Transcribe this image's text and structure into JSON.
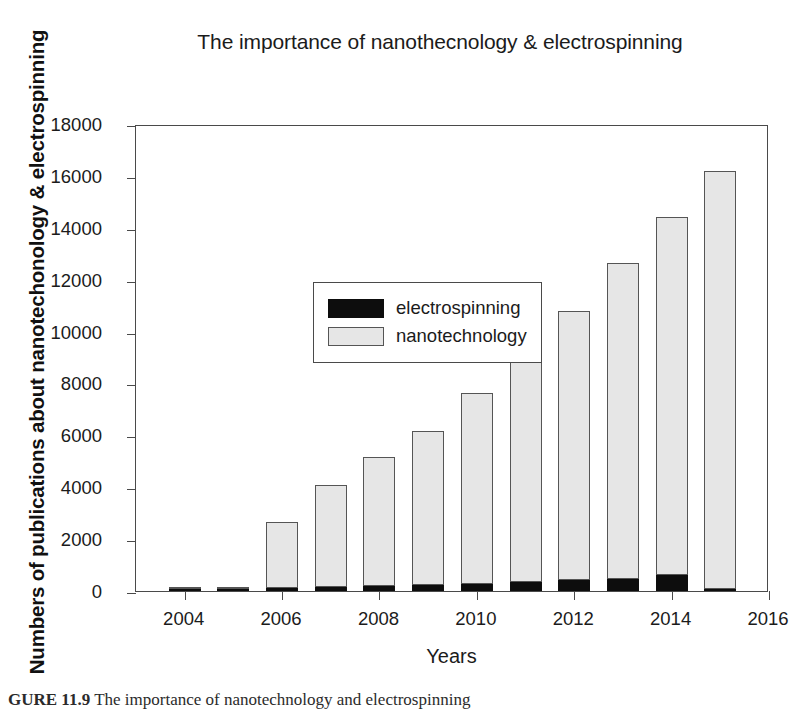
{
  "figure": {
    "caption_bold": "GURE 11.9",
    "caption_text": "The importance of nanotechnology and electrospinning"
  },
  "chart_data": {
    "type": "bar",
    "title": "The importance of nanothecnology & electrospinning",
    "xlabel": "Years",
    "ylabel": "Numbers of publications about nanotechonology & electrospinning",
    "stacked": true,
    "grid": false,
    "legend_position": "top-left",
    "categories": [
      "2004",
      "2005",
      "2006",
      "2007",
      "2008",
      "2009",
      "2010",
      "2011",
      "2012",
      "2013",
      "2014",
      "2015"
    ],
    "series": [
      {
        "name": "electrospinning",
        "color": "#0d0d0d",
        "values": [
          60,
          80,
          110,
          150,
          190,
          230,
          270,
          330,
          430,
          480,
          620,
          60
        ]
      },
      {
        "name": "nanotechnology",
        "color": "#e6e6e6",
        "values": [
          40,
          50,
          2540,
          3930,
          4960,
          5950,
          7350,
          8790,
          10350,
          12170,
          13780,
          16090
        ]
      }
    ],
    "totals": [
      100,
      130,
      2650,
      4080,
      5150,
      6180,
      7620,
      9120,
      10780,
      12650,
      14400,
      16150
    ],
    "ylim": [
      0,
      18000
    ],
    "yticks": [
      0,
      2000,
      4000,
      6000,
      8000,
      10000,
      12000,
      14000,
      16000,
      18000
    ],
    "ytick_labels": [
      "0",
      "2000",
      "4000",
      "6000",
      "8000",
      "10000",
      "12000",
      "14000",
      "16000",
      "18000"
    ],
    "xlim": [
      2003,
      2016
    ],
    "xticks": [
      2004,
      2006,
      2008,
      2010,
      2012,
      2014,
      2016
    ],
    "xtick_labels": [
      "2004",
      "2006",
      "2008",
      "2010",
      "2012",
      "2014",
      "2016"
    ]
  }
}
